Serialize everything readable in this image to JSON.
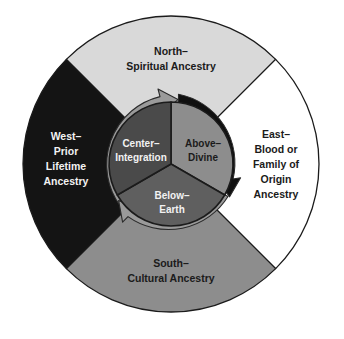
{
  "diagram": {
    "type": "concentric-wheel",
    "center": {
      "x": 171,
      "y": 164
    },
    "outer_radius": 148,
    "inner_radius": 62,
    "colors": {
      "north_fill": "#d9d9d9",
      "east_fill": "#ffffff",
      "south_fill": "#8d8d8d",
      "west_fill": "#141414",
      "center_fill": "#4a4a4a",
      "above_fill": "#8d8d8d",
      "below_fill": "#5f5f5f",
      "arrow_gray": "#9a9a9a",
      "arrow_black": "#101010",
      "stroke": "#1b1b1b",
      "text_dark": "#1b1b1b",
      "text_light": "#f2f2f2",
      "background": "#ffffff"
    },
    "outer_segments": [
      {
        "name": "north",
        "position": "top",
        "lines": [
          "North–",
          "Spiritual Ancestry"
        ],
        "fill": "#d9d9d9",
        "text_color": "dark"
      },
      {
        "name": "east",
        "position": "right",
        "lines": [
          "East–",
          "Blood or",
          "Family of",
          "Origin",
          "Ancestry"
        ],
        "fill": "#ffffff",
        "text_color": "dark"
      },
      {
        "name": "south",
        "position": "bottom",
        "lines": [
          "South–",
          "Cultural Ancestry"
        ],
        "fill": "#8d8d8d",
        "text_color": "dark"
      },
      {
        "name": "west",
        "position": "left",
        "lines": [
          "West–",
          "Prior",
          "Lifetime",
          "Ancestry"
        ],
        "fill": "#141414",
        "text_color": "light"
      }
    ],
    "inner_segments": [
      {
        "name": "center",
        "position": "left",
        "lines": [
          "Center–",
          "Integration"
        ],
        "fill": "#4a4a4a",
        "text_color": "light"
      },
      {
        "name": "above",
        "position": "upper-right",
        "lines": [
          "Above–",
          "Divine"
        ],
        "fill": "#8d8d8d",
        "text_color": "dark"
      },
      {
        "name": "below",
        "position": "bottom",
        "lines": [
          "Below–",
          "Earth"
        ],
        "fill": "#5f5f5f",
        "text_color": "light"
      }
    ],
    "arrows": [
      {
        "name": "gray-arrow-upper-left",
        "color": "#9a9a9a",
        "direction": "clockwise"
      },
      {
        "name": "black-arrow-right",
        "color": "#101010",
        "direction": "clockwise"
      },
      {
        "name": "gray-arrow-lower-left",
        "color": "#9a9a9a",
        "direction": "clockwise"
      }
    ]
  }
}
